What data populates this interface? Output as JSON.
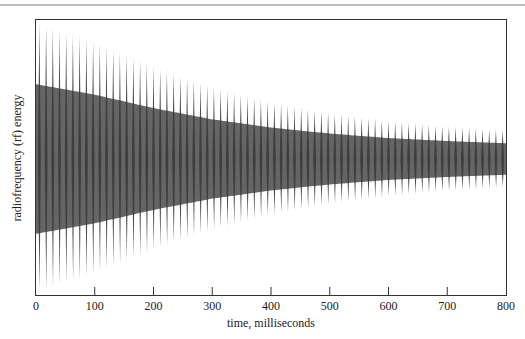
{
  "chart_data": {
    "type": "line",
    "title": "",
    "xlabel": "time, milliseconds",
    "ylabel": "radiofrequency (rf) energy",
    "xlim": [
      0,
      800
    ],
    "x_ticks": [
      0,
      100,
      200,
      300,
      400,
      500,
      600,
      700,
      800
    ],
    "y_ticks": [],
    "grid": false,
    "legend": "none",
    "series": [
      {
        "name": "rf signal (decaying oscillation)",
        "description": "Damped oscillating signal; envelope decays from full amplitude at t=0 to roughly 20% at t=800 ms",
        "envelope_x": [
          0,
          100,
          200,
          300,
          400,
          500,
          600,
          700,
          800
        ],
        "envelope_amplitude": [
          1.0,
          0.86,
          0.68,
          0.53,
          0.42,
          0.34,
          0.28,
          0.24,
          0.21
        ],
        "approx_cycles_visible": 70
      }
    ]
  },
  "colors": {
    "waveform": "#3a3a3a",
    "frame": "#333333",
    "background": "#ffffff"
  }
}
